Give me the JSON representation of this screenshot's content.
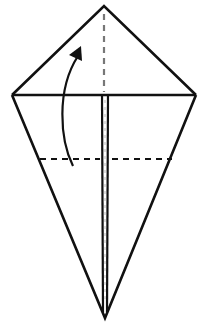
{
  "diagram": {
    "type": "origami-fold-instruction",
    "shape": "kite",
    "colors": {
      "stroke": "#111111",
      "background": "#ffffff"
    },
    "points": {
      "top": [
        104,
        6
      ],
      "left": [
        12,
        95
      ],
      "right": [
        196,
        95
      ],
      "bottom": [
        105,
        318
      ]
    },
    "lines": {
      "horizontal_fold_y": 95,
      "valley_fold_dashed_y": 159,
      "center_crease_dashed": "top point to horizontal fold",
      "center_double_edge": "horizontal fold to bottom point"
    },
    "arrow": {
      "meaning": "fold bottom flap upward along dashed line",
      "direction": "up"
    }
  }
}
